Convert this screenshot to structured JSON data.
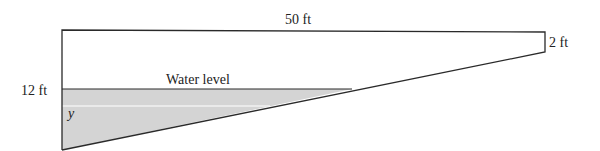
{
  "diagram": {
    "type": "trough cross-section",
    "labels": {
      "top_length": "50 ft",
      "right_depth": "2 ft",
      "left_depth": "12 ft",
      "water_level": "Water level",
      "variable": "y"
    },
    "colors": {
      "water_fill": "#d4d4d4",
      "outline": "#2a2a2a",
      "background": "#ffffff"
    }
  }
}
